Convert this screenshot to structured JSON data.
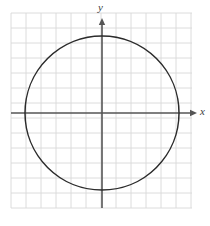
{
  "figure": {
    "type": "coordinate-plane-with-circle",
    "background_color": "#ffffff",
    "axis_labels": {
      "x": "x",
      "y": "y"
    }
  },
  "grid": {
    "color": "#d8d8d8",
    "left": 11,
    "top": 13,
    "right": 192,
    "bottom": 208,
    "cell_size": 15,
    "columns": 12,
    "rows": 13,
    "visible": true
  },
  "axes": {
    "color": "#555555",
    "stroke_width": 1.6,
    "origin_x": 102,
    "origin_y": 113,
    "x_axis_start": 11,
    "x_axis_end": 197,
    "y_axis_start": 18,
    "y_axis_end": 208,
    "arrowheads": [
      "x-positive",
      "y-positive"
    ],
    "tick_labels": [],
    "show_numbers": false
  },
  "chart_data": {
    "type": "scatter",
    "title": "",
    "xlabel": "x",
    "ylabel": "y",
    "grid": true,
    "legend": null,
    "xlim": [
      -6.07,
      6.33
    ],
    "ylim": [
      -6.33,
      6.67
    ],
    "shapes": [
      {
        "kind": "circle",
        "center_x": 0,
        "center_y": 0,
        "radius_units": 5.13,
        "center_px": [
          102,
          113
        ],
        "radius_px": 77,
        "stroke": "#2b2b2b",
        "stroke_width": 1.5,
        "fill": "none"
      }
    ],
    "annotations": []
  }
}
